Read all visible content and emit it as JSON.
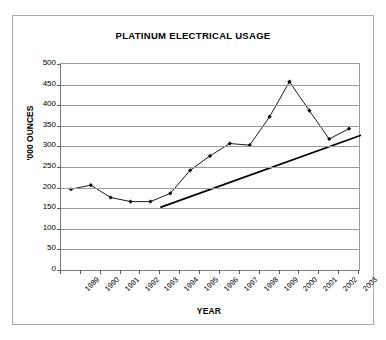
{
  "chart_data": {
    "type": "line",
    "title": "PLATINUM ELECTRICAL USAGE",
    "xlabel": "YEAR",
    "ylabel": "'000 OUNCES",
    "categories": [
      "1989",
      "1990",
      "1991",
      "1992",
      "1993",
      "1994",
      "1995",
      "1996",
      "1997",
      "1998",
      "1999",
      "2000",
      "2001",
      "2002",
      "2003"
    ],
    "ylim": [
      0,
      500
    ],
    "ytick_labels": [
      "500",
      "450",
      "400",
      "350",
      "300",
      "250",
      "200",
      "150",
      "100",
      "50",
      "0"
    ],
    "ytick_values": [
      500,
      450,
      400,
      350,
      300,
      250,
      200,
      150,
      100,
      50,
      0
    ],
    "grid": true,
    "legend": false,
    "series": [
      {
        "name": "Platinum electrical usage",
        "marker": "diamond",
        "color": "#000000",
        "values": [
          196,
          206,
          176,
          166,
          166,
          186,
          242,
          277,
          307,
          303,
          372,
          457,
          387,
          318,
          343
        ]
      },
      {
        "name": "Trendline",
        "type": "trendline",
        "marker": "none",
        "color": "#000000",
        "start": {
          "category_index": 4.5,
          "value": 152
        },
        "end": {
          "category_index": 14.6,
          "value": 327
        }
      }
    ]
  },
  "chart": {
    "title": "PLATINUM ELECTRICAL USAGE",
    "y_axis_title": "'000 OUNCES",
    "x_axis_title": "YEAR"
  },
  "colors": {
    "frame_border": "#a8a8a8",
    "gridline": "#9a9a9a",
    "axis": "#5a5a5a",
    "series_line": "#000000",
    "trendline": "#000000",
    "background": "#ffffff"
  }
}
